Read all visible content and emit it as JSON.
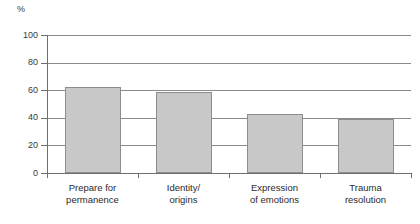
{
  "chart_data": {
    "type": "bar",
    "title": "",
    "subtitle": "",
    "xlabel": "",
    "ylabel": "%",
    "ylim": [
      0,
      100
    ],
    "yticks": [
      0,
      20,
      40,
      60,
      80,
      100
    ],
    "grid": true,
    "legend": null,
    "categories": [
      "Prepare for permanence",
      "Identity/ origins",
      "Expression of emotions",
      "Trauma resolution"
    ],
    "category_lines": [
      [
        "Prepare for",
        "permanence"
      ],
      [
        "Identity/",
        "origins"
      ],
      [
        "Expression",
        "of emotions"
      ],
      [
        "Trauma",
        "resolution"
      ]
    ],
    "values": [
      62,
      59,
      43,
      39
    ],
    "colors": {
      "bar_fill": "#c8c8c8",
      "bar_border": "#8c8c8c",
      "gridline": "#8a8a8a",
      "axis": "#6e6e6e",
      "text": "#2a2a2a"
    }
  },
  "axis": {
    "unit_label": "%",
    "tick_labels": [
      "100",
      "80",
      "60",
      "40",
      "20",
      "0"
    ]
  }
}
